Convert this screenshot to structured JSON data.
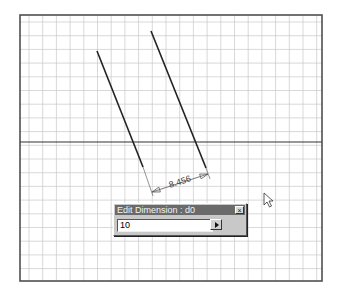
{
  "viewport": {
    "frame": {
      "x": 20,
      "y": 15,
      "width": 302,
      "height": 266
    },
    "grid": {
      "spacing": 13.7,
      "origin_x": 29,
      "origin_y": 22,
      "color": "#c8c8c8"
    },
    "axis_y": 142
  },
  "sketch": {
    "lines": [
      {
        "x1": 97,
        "y1": 51,
        "x2": 143,
        "y2": 167
      },
      {
        "x1": 151,
        "y1": 31,
        "x2": 206,
        "y2": 168
      }
    ],
    "extension_lines": [
      {
        "x1": 143,
        "y1": 167,
        "x2": 153,
        "y2": 196
      },
      {
        "x1": 206,
        "y1": 168,
        "x2": 210,
        "y2": 179
      }
    ],
    "dimension": {
      "value": "8.456",
      "x1": 152,
      "y1": 192,
      "x2": 208,
      "y2": 174,
      "label_x": 170,
      "label_y": 188
    }
  },
  "dialog": {
    "title": "Edit Dimension : d0",
    "close_label": "×",
    "input_value": "10"
  },
  "cursor": {
    "x": 264,
    "y": 193
  }
}
